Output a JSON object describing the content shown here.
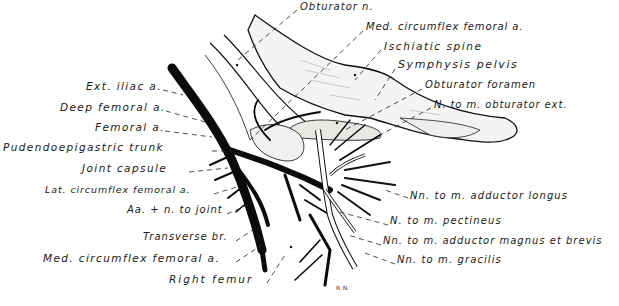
{
  "figure": {
    "signature": "R.N.",
    "labels_left": [
      {
        "id": "ext-iliac-a",
        "text": "Ext. iliac a.",
        "x": 86,
        "y": 86
      },
      {
        "id": "deep-femoral-a",
        "text": "Deep femoral a.",
        "x": 60,
        "y": 107
      },
      {
        "id": "femoral-a",
        "text": "Femoral a.",
        "x": 95,
        "y": 127
      },
      {
        "id": "pudendoepigastric-trunk",
        "text": "Pudendoepigastric trunk",
        "x": 3,
        "y": 147
      },
      {
        "id": "joint-capsule",
        "text": "Joint capsule",
        "x": 82,
        "y": 168
      },
      {
        "id": "lat-circumflex-femoral-a",
        "text": "Lat. circumflex femoral a.",
        "x": 45,
        "y": 190
      },
      {
        "id": "aa-n-to-joint",
        "text": "Aa. + n. to joint",
        "x": 127,
        "y": 210
      },
      {
        "id": "transverse-br",
        "text": "Transverse br.",
        "x": 143,
        "y": 237
      },
      {
        "id": "med-circumflex-femoral-a-lower",
        "text": "Med. circumflex femoral a.",
        "x": 43,
        "y": 258
      },
      {
        "id": "right-femur",
        "text": "Right femur",
        "x": 169,
        "y": 279
      }
    ],
    "labels_right": [
      {
        "id": "obturator-n",
        "text": "Obturator n.",
        "x": 300,
        "y": 6
      },
      {
        "id": "med-circumflex-femoral-a-upper",
        "text": "Med. circumflex femoral a.",
        "x": 366,
        "y": 26
      },
      {
        "id": "ischiatic-spine",
        "text": "Ischiatic spine",
        "x": 384,
        "y": 45
      },
      {
        "id": "symphysis-pelvis",
        "text": "Symphysis pelvis",
        "x": 398,
        "y": 64
      },
      {
        "id": "obturator-foramen",
        "text": "Obturator foramen",
        "x": 425,
        "y": 84
      },
      {
        "id": "n-to-m-obturator-ext",
        "text": "N. to m. obturator ext.",
        "x": 434,
        "y": 104
      },
      {
        "id": "nn-to-m-adductor-longus",
        "text": "Nn. to m. adductor longus",
        "x": 410,
        "y": 195
      },
      {
        "id": "n-to-m-pectineus",
        "text": "N. to m. pectineus",
        "x": 390,
        "y": 221
      },
      {
        "id": "nn-to-m-adductor-magnus-et-brevis",
        "text": "Nn. to m. adductor magnus et brevis",
        "x": 383,
        "y": 241
      },
      {
        "id": "nn-to-m-gracilis",
        "text": "Nn. to m. gracilis",
        "x": 397,
        "y": 260
      }
    ],
    "colors": {
      "ink": "#111111",
      "label": "#1a1a1a",
      "bone_fill": "#f3f3f1",
      "nerve_fill": "#ffffff",
      "shade": "#9a9a9a"
    }
  }
}
